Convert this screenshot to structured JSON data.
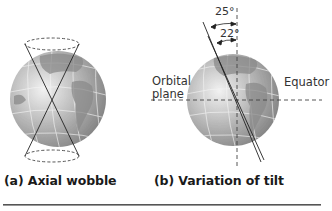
{
  "panels": [
    {
      "id": "a",
      "caption": "(a) Axial wobble"
    },
    {
      "id": "b",
      "caption": "(b) Variation of tilt",
      "labels": {
        "orbital_plane_line1": "Orbital",
        "orbital_plane_line2": "plane",
        "equator": "Equator"
      },
      "angles": {
        "max": "25°",
        "min": "22°"
      }
    }
  ],
  "colors": {
    "globe_light": "#e8e8e8",
    "globe_mid": "#a8a8a8",
    "globe_dark": "#6e6e6e",
    "line": "#222222",
    "dash": "#444444"
  }
}
